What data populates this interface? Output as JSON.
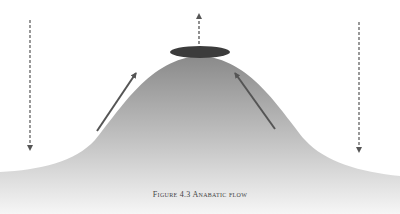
{
  "figure": {
    "caption": "Figure 4.3 Anabatic flow",
    "colors": {
      "mountain_top": "#8e8e8e",
      "mountain_bottom": "#f4f4f4",
      "cap_cloud": "#3c3c3c",
      "arrow": "#555555",
      "background": "#ffffff"
    }
  },
  "elements": {
    "mountain": "mountain-slope",
    "cloud": "cap-cloud",
    "arrows": [
      {
        "name": "dashed-down-arrow-left",
        "style": "dashed",
        "direction": "down"
      },
      {
        "name": "upslope-arrow-left",
        "style": "solid",
        "direction": "up-right"
      },
      {
        "name": "dashed-up-arrow-center",
        "style": "dashed",
        "direction": "up"
      },
      {
        "name": "upslope-arrow-right",
        "style": "solid",
        "direction": "up-left"
      },
      {
        "name": "dashed-down-arrow-right",
        "style": "dashed",
        "direction": "down"
      }
    ]
  }
}
